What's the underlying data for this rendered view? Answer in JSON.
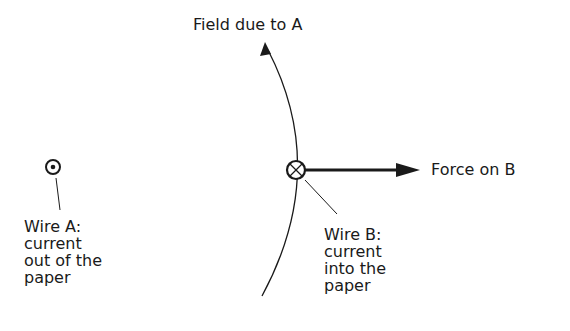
{
  "labels": {
    "field": "Field due to A",
    "force": "Force on B",
    "wire_a": [
      "Wire A:",
      "current",
      "out of the",
      "paper"
    ],
    "wire_b": [
      "Wire B:",
      "current",
      "into the",
      "paper"
    ]
  },
  "symbols": {
    "wire_a": "dot-in-circle (current out of page)",
    "wire_b": "cross-in-circle (current into page)"
  },
  "colors": {
    "ink": "#1a1a1a",
    "background": "#ffffff"
  }
}
